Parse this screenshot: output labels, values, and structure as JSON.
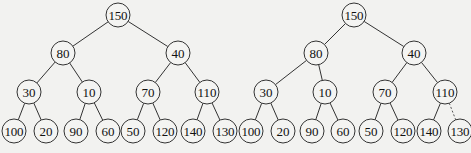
{
  "trees": [
    {
      "id": "left",
      "nodes": [
        {
          "id": "n1",
          "label": "150",
          "x": 118,
          "y": 15
        },
        {
          "id": "n2",
          "label": "80",
          "x": 63,
          "y": 53
        },
        {
          "id": "n3",
          "label": "40",
          "x": 178,
          "y": 53
        },
        {
          "id": "n4",
          "label": "30",
          "x": 29,
          "y": 92
        },
        {
          "id": "n5",
          "label": "10",
          "x": 89,
          "y": 92
        },
        {
          "id": "n6",
          "label": "70",
          "x": 148,
          "y": 92
        },
        {
          "id": "n7",
          "label": "110",
          "x": 207,
          "y": 92
        },
        {
          "id": "n8",
          "label": "100",
          "x": 14,
          "y": 131
        },
        {
          "id": "n9",
          "label": "20",
          "x": 46,
          "y": 131
        },
        {
          "id": "n10",
          "label": "90",
          "x": 76,
          "y": 131
        },
        {
          "id": "n11",
          "label": "60",
          "x": 108,
          "y": 131
        },
        {
          "id": "n12",
          "label": "50",
          "x": 133,
          "y": 131
        },
        {
          "id": "n13",
          "label": "120",
          "x": 165,
          "y": 131
        },
        {
          "id": "n14",
          "label": "140",
          "x": 193,
          "y": 131
        },
        {
          "id": "n15",
          "label": "130",
          "x": 225,
          "y": 131
        }
      ],
      "edges": [
        [
          "n1",
          "n2",
          false
        ],
        [
          "n1",
          "n3",
          false
        ],
        [
          "n2",
          "n4",
          false
        ],
        [
          "n2",
          "n5",
          false
        ],
        [
          "n3",
          "n6",
          false
        ],
        [
          "n3",
          "n7",
          false
        ],
        [
          "n4",
          "n8",
          false
        ],
        [
          "n4",
          "n9",
          false
        ],
        [
          "n5",
          "n10",
          false
        ],
        [
          "n5",
          "n11",
          false
        ],
        [
          "n6",
          "n12",
          false
        ],
        [
          "n6",
          "n13",
          false
        ],
        [
          "n7",
          "n14",
          false
        ],
        [
          "n7",
          "n15",
          false
        ]
      ]
    },
    {
      "id": "right",
      "nodes": [
        {
          "id": "m1",
          "label": "150",
          "x": 354,
          "y": 15
        },
        {
          "id": "m2",
          "label": "80",
          "x": 316,
          "y": 53
        },
        {
          "id": "m3",
          "label": "40",
          "x": 414,
          "y": 53
        },
        {
          "id": "m4",
          "label": "30",
          "x": 266,
          "y": 92
        },
        {
          "id": "m5",
          "label": "10",
          "x": 325,
          "y": 92
        },
        {
          "id": "m6",
          "label": "70",
          "x": 385,
          "y": 92
        },
        {
          "id": "m7",
          "label": "110",
          "x": 445,
          "y": 92
        },
        {
          "id": "m8",
          "label": "100",
          "x": 251,
          "y": 131
        },
        {
          "id": "m9",
          "label": "20",
          "x": 283,
          "y": 131
        },
        {
          "id": "m10",
          "label": "90",
          "x": 312,
          "y": 131
        },
        {
          "id": "m11",
          "label": "60",
          "x": 343,
          "y": 131
        },
        {
          "id": "m12",
          "label": "50",
          "x": 371,
          "y": 131
        },
        {
          "id": "m13",
          "label": "120",
          "x": 403,
          "y": 131
        },
        {
          "id": "m14",
          "label": "140",
          "x": 429,
          "y": 131
        },
        {
          "id": "m15",
          "label": "130",
          "x": 460,
          "y": 131
        }
      ],
      "edges": [
        [
          "m1",
          "m2",
          false
        ],
        [
          "m1",
          "m3",
          false
        ],
        [
          "m2",
          "m4",
          false
        ],
        [
          "m2",
          "m5",
          false
        ],
        [
          "m3",
          "m6",
          false
        ],
        [
          "m3",
          "m7",
          false
        ],
        [
          "m4",
          "m8",
          false
        ],
        [
          "m4",
          "m9",
          false
        ],
        [
          "m5",
          "m10",
          false
        ],
        [
          "m5",
          "m11",
          false
        ],
        [
          "m6",
          "m12",
          false
        ],
        [
          "m6",
          "m13",
          false
        ],
        [
          "m7",
          "m14",
          false
        ],
        [
          "m7",
          "m15",
          true
        ]
      ]
    }
  ],
  "style": {
    "node_radius": 12,
    "stroke": "#333333",
    "background": "#f2f2f0"
  }
}
